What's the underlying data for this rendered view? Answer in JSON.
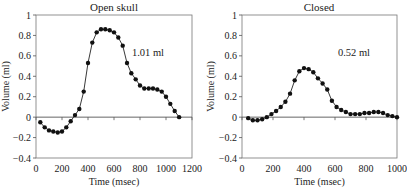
{
  "chart_data": [
    {
      "type": "line",
      "title": "Open skull",
      "annotation": "1.01 ml",
      "xlabel": "Time (msec)",
      "ylabel": "Volume (ml)",
      "xlim": [
        0,
        1200
      ],
      "ylim": [
        -0.4,
        1
      ],
      "xticks": [
        0,
        200,
        400,
        600,
        800,
        1000,
        1200
      ],
      "yticks": [
        -0.4,
        -0.2,
        0,
        0.2,
        0.4,
        0.6,
        0.8,
        1
      ],
      "ytick_labels": [
        "-0.4",
        "-0.2",
        "0",
        "0.2",
        "0.4",
        "0.6",
        "0.8",
        "1"
      ],
      "grid": false,
      "x": [
        33,
        67,
        100,
        133,
        167,
        200,
        233,
        267,
        300,
        333,
        367,
        400,
        433,
        467,
        500,
        533,
        567,
        600,
        633,
        667,
        700,
        733,
        767,
        800,
        833,
        867,
        900,
        933,
        967,
        1000,
        1033,
        1067
      ],
      "values": [
        -0.05,
        -0.1,
        -0.13,
        -0.14,
        -0.15,
        -0.14,
        -0.1,
        -0.04,
        0.02,
        0.08,
        0.25,
        0.53,
        0.73,
        0.83,
        0.86,
        0.86,
        0.85,
        0.83,
        0.78,
        0.7,
        0.53,
        0.43,
        0.37,
        0.31,
        0.28,
        0.28,
        0.28,
        0.27,
        0.25,
        0.2,
        0.13,
        0.06,
        0.0
      ]
    },
    {
      "type": "line",
      "title": "Closed",
      "annotation": "0.52 ml",
      "xlabel": "Time (msec)",
      "ylabel": "Volume (ml)",
      "xlim": [
        0,
        1000
      ],
      "ylim": [
        -0.4,
        1
      ],
      "xticks": [
        0,
        200,
        400,
        600,
        800,
        1000
      ],
      "yticks": [
        -0.4,
        -0.2,
        0,
        0.2,
        0.4,
        0.6,
        0.8,
        1
      ],
      "ytick_labels": [
        "-0.4",
        "-0.2",
        "0",
        "0.2",
        "0.4",
        "0.6",
        "0.8",
        "1"
      ],
      "grid": false,
      "x": [
        40,
        70,
        100,
        130,
        160,
        190,
        220,
        250,
        280,
        310,
        340,
        370,
        400,
        430,
        460,
        490,
        520,
        550,
        580,
        610,
        640,
        670,
        700,
        730,
        760,
        790,
        820,
        850,
        880,
        910,
        940,
        970
      ],
      "values": [
        -0.01,
        -0.03,
        -0.03,
        -0.02,
        0.0,
        0.03,
        0.06,
        0.1,
        0.15,
        0.23,
        0.36,
        0.45,
        0.48,
        0.47,
        0.44,
        0.38,
        0.33,
        0.27,
        0.16,
        0.1,
        0.07,
        0.05,
        0.03,
        0.03,
        0.03,
        0.04,
        0.04,
        0.05,
        0.05,
        0.04,
        0.02,
        0.01,
        0.0
      ]
    }
  ]
}
